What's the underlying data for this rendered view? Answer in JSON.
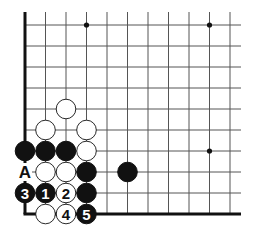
{
  "diagram": {
    "type": "go-board-corner",
    "grid": {
      "x0": 25,
      "y0": 25,
      "dx": 20.5,
      "dy": 21,
      "cols": 11,
      "rows": 10,
      "line_color": "#555555",
      "edge_color": "#111111"
    },
    "star_points": [
      [
        3,
        0
      ],
      [
        9,
        0
      ],
      [
        9,
        6
      ]
    ],
    "stones": [
      {
        "color": "white",
        "col": 2,
        "row": 4,
        "label": ""
      },
      {
        "color": "white",
        "col": 1,
        "row": 5,
        "label": ""
      },
      {
        "color": "white",
        "col": 3,
        "row": 5,
        "label": ""
      },
      {
        "color": "black",
        "col": 0,
        "row": 6,
        "label": ""
      },
      {
        "color": "black",
        "col": 1,
        "row": 6,
        "label": ""
      },
      {
        "color": "black",
        "col": 2,
        "row": 6,
        "label": ""
      },
      {
        "color": "white",
        "col": 3,
        "row": 6,
        "label": ""
      },
      {
        "color": "white",
        "col": 1,
        "row": 7,
        "label": ""
      },
      {
        "color": "white",
        "col": 2,
        "row": 7,
        "label": ""
      },
      {
        "color": "black",
        "col": 3,
        "row": 7,
        "label": ""
      },
      {
        "color": "black",
        "col": 5,
        "row": 7,
        "label": ""
      },
      {
        "color": "black",
        "col": 0,
        "row": 8,
        "label": "3"
      },
      {
        "color": "black",
        "col": 1,
        "row": 8,
        "label": "1"
      },
      {
        "color": "white",
        "col": 2,
        "row": 8,
        "label": "2"
      },
      {
        "color": "black",
        "col": 3,
        "row": 8,
        "label": ""
      },
      {
        "color": "white",
        "col": 1,
        "row": 9,
        "label": ""
      },
      {
        "color": "white",
        "col": 2,
        "row": 9,
        "label": "4"
      },
      {
        "color": "black",
        "col": 3,
        "row": 9,
        "label": "5"
      }
    ],
    "markers": [
      {
        "col": 0,
        "row": 7,
        "label": "A"
      }
    ]
  }
}
